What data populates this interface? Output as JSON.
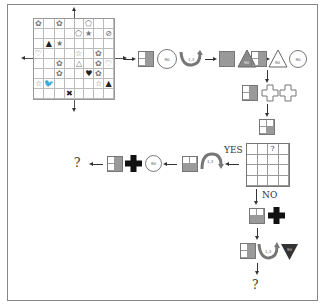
{
  "diagram": {
    "grid": {
      "rows": 8,
      "cols": 8,
      "cells": [
        [
          "pentagon-flower",
          "",
          "flower",
          "",
          "",
          "pentagon",
          "",
          ""
        ],
        [
          "",
          "",
          "",
          "",
          "pentagon",
          "star",
          "",
          "no-sign"
        ],
        [
          "",
          "triangle",
          "star",
          "",
          "",
          "",
          "",
          ""
        ],
        [
          "heart-outline",
          "",
          "",
          "",
          "star-outline",
          "",
          "flower",
          ""
        ],
        [
          "",
          "",
          "flower",
          "",
          "triangle-outline",
          "",
          "flower",
          "heart-outline"
        ],
        [
          "",
          "",
          "flower",
          "",
          "",
          "heart",
          "flower",
          ""
        ],
        [
          "star-outline",
          "bird",
          "",
          "",
          "",
          "",
          "star-outline",
          "triangle"
        ],
        [
          "",
          "",
          "",
          "x-mark",
          "",
          "",
          "",
          ""
        ]
      ]
    },
    "step1": {
      "circle_label": "90",
      "rotate_label": "1,3"
    },
    "step2": {
      "triangle_label": "90"
    },
    "step3": {
      "triangle_label": "90",
      "circle_label": "90"
    },
    "query_grid": {
      "rows": 4,
      "cols": 4,
      "mark": "?",
      "mark_row": 0,
      "mark_col": 2
    },
    "yes_label": "YES",
    "no_label": "NO",
    "yes_branch": {
      "rotate_label": "1,3",
      "circle_label": "90",
      "result": "?"
    },
    "no_branch": {
      "rotate_label": "1,3",
      "triangle_label": "90",
      "result": "?"
    }
  },
  "colors": {
    "line": "#333333",
    "grid": "#bbbbbb",
    "fill_gray": "#9a9a9a",
    "fill_dark": "#333333"
  }
}
